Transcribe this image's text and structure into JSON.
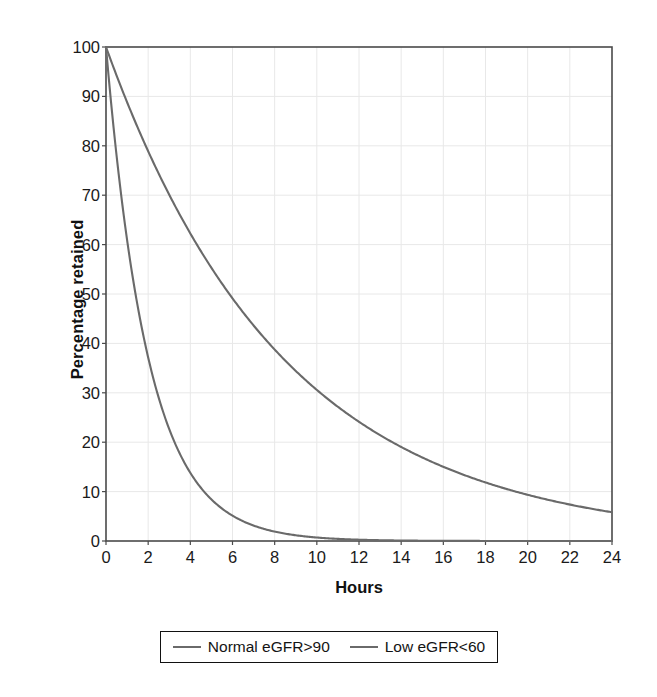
{
  "chart_data": {
    "type": "line",
    "title": "",
    "subtitle": "",
    "xlabel": "Hours",
    "ylabel": "Percentage retained",
    "xlim": [
      0,
      24
    ],
    "ylim": [
      0,
      100
    ],
    "xticks": [
      0,
      2,
      4,
      6,
      8,
      10,
      12,
      14,
      16,
      18,
      20,
      22,
      24
    ],
    "yticks": [
      0,
      10,
      20,
      30,
      40,
      50,
      60,
      70,
      80,
      90,
      100
    ],
    "xtick_labels": [
      "0",
      "2",
      "4",
      "6",
      "8",
      "10",
      "12",
      "14",
      "16",
      "18",
      "20",
      "22",
      "24"
    ],
    "ytick_labels": [
      "0",
      "10",
      "20",
      "30",
      "40",
      "50",
      "60",
      "70",
      "80",
      "90",
      "100"
    ],
    "grid": true,
    "grid_color": "#e8e8e8",
    "legend_position": "below-center",
    "x": [
      0,
      1,
      2,
      3,
      4,
      5,
      6,
      7,
      8,
      9,
      10,
      11,
      12,
      13,
      14,
      15,
      16,
      17,
      18,
      19,
      20,
      21,
      22,
      23,
      24
    ],
    "series": [
      {
        "name": "Normal eGFR>90",
        "color": "#6a6a6a",
        "half_life_hours": 1.4,
        "values": [
          100,
          61,
          37.2,
          22.7,
          13.8,
          8.4,
          5.2,
          3.1,
          1.9,
          1.2,
          0.7,
          0.4,
          0.3,
          0.2,
          0.1,
          0.07,
          0.04,
          0.02,
          0.01,
          0.01,
          0.0,
          0.0,
          0.0,
          0.0,
          0.0
        ]
      },
      {
        "name": "Low eGFR<60",
        "color": "#6a6a6a",
        "half_life_hours": 5.85,
        "values": [
          100,
          88.9,
          79.0,
          70.2,
          62.4,
          55.5,
          49.3,
          43.8,
          38.9,
          34.6,
          30.8,
          27.3,
          24.3,
          21.6,
          19.2,
          17.1,
          15.2,
          13.5,
          12.0,
          10.6,
          9.5,
          8.4,
          7.5,
          6.6,
          5.9
        ]
      }
    ]
  },
  "axes": {
    "y_title": "Percentage retained",
    "x_title": "Hours"
  },
  "legend": {
    "entries": [
      {
        "label": "Normal eGFR>90",
        "color": "#6a6a6a"
      },
      {
        "label": "Low eGFR<60",
        "color": "#6a6a6a"
      }
    ]
  }
}
